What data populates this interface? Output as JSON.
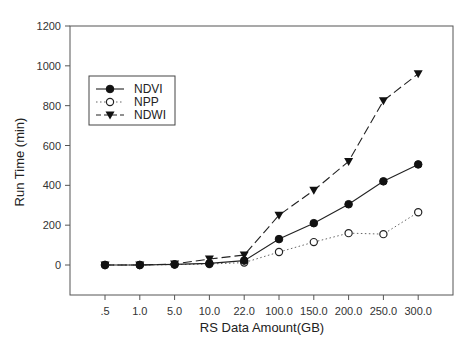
{
  "chart_data": {
    "type": "line",
    "title": "",
    "xlabel": "RS Data Amount(GB)",
    "ylabel": "Run Time (min)",
    "categories": [
      ".5",
      "1.0",
      "5.0",
      "10.0",
      "22.0",
      "100.0",
      "150.0",
      "200.0",
      "250.0",
      "300.0"
    ],
    "ylim": [
      -150,
      1200
    ],
    "yticks": [
      0,
      200,
      400,
      600,
      800,
      1000,
      1200
    ],
    "grid": false,
    "legend_position": "upper-left inside",
    "series": [
      {
        "name": "NDVI",
        "marker": "filled-circle",
        "line": "solid",
        "values": [
          0,
          0,
          3,
          8,
          22,
          130,
          210,
          305,
          420,
          505
        ]
      },
      {
        "name": "NPP",
        "marker": "open-circle",
        "line": "dotted",
        "values": [
          0,
          0,
          2,
          5,
          12,
          65,
          115,
          160,
          155,
          265
        ]
      },
      {
        "name": "NDWI",
        "marker": "filled-triangle-down",
        "line": "dashed",
        "values": [
          0,
          0,
          5,
          30,
          50,
          250,
          375,
          520,
          825,
          960
        ]
      }
    ]
  }
}
